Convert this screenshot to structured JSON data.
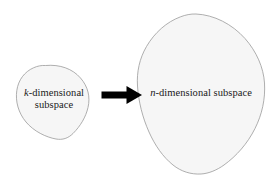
{
  "figure": {
    "type": "diagram",
    "background_color": "#ffffff",
    "width": 276,
    "height": 178,
    "shapes": {
      "small_blob": {
        "name": "k-dimensional-subspace-blob",
        "fill_color": "#f6f6f6",
        "stroke_color": "#9a9a9a",
        "stroke_width": 0.8
      },
      "large_blob": {
        "name": "n-dimensional-subspace-blob",
        "fill_color": "#f6f6f6",
        "stroke_color": "#9a9a9a",
        "stroke_width": 0.8
      }
    },
    "arrow": {
      "name": "mapping-arrow",
      "color": "#000000",
      "direction": "right",
      "from": "k-dimensional subspace",
      "to": "n-dimensional subspace"
    },
    "labels": {
      "source": {
        "variable": "k",
        "suffix": "-dimensional",
        "second_line": "subspace",
        "full_text": "k-dimensional subspace",
        "color": "#1a1a1a"
      },
      "target": {
        "variable": "n",
        "suffix": "-dimensional subspace",
        "full_text": "n-dimensional subspace",
        "color": "#1a1a1a"
      }
    }
  }
}
